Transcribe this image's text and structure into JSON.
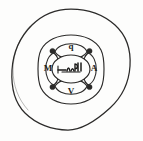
{
  "figure": {
    "kind": "hand-drawn-sketch",
    "title": "Directional wheel sketch",
    "background_color": "#fdfdfc",
    "ink_color": "#2b2a29"
  },
  "outer_ring": {
    "name": "outer-circle",
    "center_x": 71,
    "center_y": 70,
    "radius_x": 59,
    "radius_y": 61,
    "stroke_width": 1.2
  },
  "mid_ring": {
    "name": "middle-ring",
    "center_x": 71,
    "center_y": 69,
    "outer_radius": 33,
    "inner_radius": 19,
    "stroke_width": 1.1,
    "segment_count": 4
  },
  "hub": {
    "name": "center-hub",
    "center_x": 71,
    "center_y": 69,
    "radius_x": 19,
    "radius_y": 14,
    "stroke_width": 1.1,
    "inscription": "illegible handwritten scrawl"
  },
  "directions": [
    {
      "id": "up",
      "label": "q",
      "x": 71,
      "y": 46,
      "angle_deg": 270
    },
    {
      "id": "right",
      "label": "A",
      "x": 94,
      "y": 69,
      "angle_deg": 0
    },
    {
      "id": "down",
      "label": "V",
      "x": 71,
      "y": 92,
      "angle_deg": 90
    },
    {
      "id": "left",
      "label": "M",
      "x": 48,
      "y": 69,
      "angle_deg": 180
    }
  ],
  "joint_nodes": [
    {
      "id": "joint-nw",
      "x": 53,
      "y": 51,
      "r": 2.6
    },
    {
      "id": "joint-ne",
      "x": 89,
      "y": 51,
      "r": 2.6
    },
    {
      "id": "joint-se",
      "x": 89,
      "y": 87,
      "r": 2.6
    },
    {
      "id": "joint-sw",
      "x": 53,
      "y": 87,
      "r": 2.6
    }
  ],
  "spokes": [
    {
      "id": "spoke-nw",
      "x1": 57,
      "y1": 56,
      "x2": 53,
      "y2": 51
    },
    {
      "id": "spoke-ne",
      "x1": 85,
      "y1": 56,
      "x2": 89,
      "y2": 51
    },
    {
      "id": "spoke-se",
      "x1": 85,
      "y1": 82,
      "x2": 89,
      "y2": 87
    },
    {
      "id": "spoke-sw",
      "x1": 57,
      "y1": 82,
      "x2": 53,
      "y2": 87
    }
  ]
}
